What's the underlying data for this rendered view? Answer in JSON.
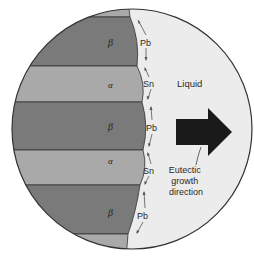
{
  "figure": {
    "colors": {
      "background": "#ffffff",
      "liquid": "#ececec",
      "beta_phase": "#7a7a7a",
      "alpha_phase": "#a9a9a9",
      "outline": "#333333",
      "growth_arrow": "#1a1a1a"
    },
    "phases": [
      {
        "name": "alpha",
        "symbol": "α",
        "y_top": 5,
        "y_bottom": 17,
        "labeled": false
      },
      {
        "name": "beta",
        "symbol": "β",
        "y_top": 17,
        "y_bottom": 66,
        "labeled": true
      },
      {
        "name": "alpha",
        "symbol": "α",
        "y_top": 66,
        "y_bottom": 102,
        "labeled": true
      },
      {
        "name": "beta",
        "symbol": "β",
        "y_top": 102,
        "y_bottom": 150,
        "labeled": true
      },
      {
        "name": "alpha",
        "symbol": "α",
        "y_top": 150,
        "y_bottom": 185,
        "labeled": true
      },
      {
        "name": "beta",
        "symbol": "β",
        "y_top": 185,
        "y_bottom": 234,
        "labeled": true
      },
      {
        "name": "alpha",
        "symbol": "α",
        "y_top": 234,
        "y_bottom": 252,
        "labeled": false
      }
    ],
    "phase_labels": [
      "β",
      "α",
      "β",
      "α",
      "β"
    ],
    "diffusion_labels": [
      "Pb",
      "Sn",
      "Pb",
      "Sn",
      "Pb"
    ],
    "liquid_label": "Liquid",
    "growth_label": {
      "line1": "Eutectic",
      "line2": "growth",
      "line3": "direction"
    }
  }
}
